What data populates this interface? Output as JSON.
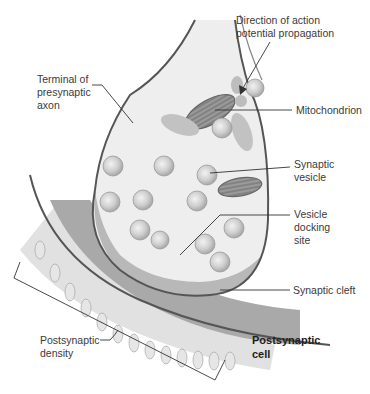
{
  "figure": {
    "type": "anatomical-diagram",
    "colors": {
      "background": "#ffffff",
      "cell_fill": "#eeeeee",
      "cell_shadow": "#c4c4c4",
      "membrane": "#555555",
      "vesicle": "#c9c9c9",
      "mitochondrion": "#9a9a9a",
      "postsynaptic_band": "#a9a9a9",
      "leader_line": "#333333"
    }
  },
  "labels": {
    "direction": "Direction of action\npotential propagation",
    "terminal": "Terminal of\npresynaptic\naxon",
    "mitochondrion": "Mitochondrion",
    "synaptic_vesicle": "Synaptic\nvesicle",
    "docking_site": "Vesicle\ndocking\nsite",
    "synaptic_cleft": "Synaptic cleft",
    "postsynaptic_density": "Postsynaptic\ndensity",
    "postsynaptic_cell": "Postsynaptic\ncell"
  }
}
